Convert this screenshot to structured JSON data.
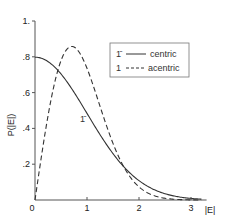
{
  "chart_data": {
    "type": "line",
    "title": "",
    "xlabel": "|E|",
    "ylabel": "P(|E|)",
    "xlim": [
      0,
      3.3
    ],
    "ylim": [
      0,
      1.0
    ],
    "x_ticks": [
      0,
      1,
      2,
      3
    ],
    "x_tick_labels": [
      "0",
      "1",
      "2",
      "3"
    ],
    "y_ticks": [
      0.2,
      0.4,
      0.6,
      0.8,
      1.0
    ],
    "y_tick_labels": [
      ".2",
      ".4",
      ".6",
      ".8",
      "1."
    ],
    "grid": false,
    "legend": {
      "placement": "top-right",
      "entries": [
        {
          "symbol": "1̄",
          "style": "solid",
          "label": "centric"
        },
        {
          "symbol": "1",
          "style": "dashed",
          "label": "acentric"
        }
      ]
    },
    "annotations": [
      {
        "text": "1̄",
        "series": "centric"
      },
      {
        "text": "1",
        "series": "acentric"
      }
    ],
    "series": [
      {
        "name": "centric",
        "style": "solid",
        "formula": "sqrt(2/pi)*exp(-E^2/2)",
        "x": [
          0,
          0.25,
          0.5,
          0.75,
          1.0,
          1.25,
          1.5,
          1.75,
          2.0,
          2.25,
          2.5,
          2.75,
          3.0,
          3.2
        ],
        "y": [
          0.798,
          0.773,
          0.704,
          0.601,
          0.484,
          0.366,
          0.26,
          0.173,
          0.108,
          0.064,
          0.035,
          0.018,
          0.009,
          0.005
        ]
      },
      {
        "name": "acentric",
        "style": "dashed",
        "formula": "2*E*exp(-E^2)",
        "x": [
          0,
          0.25,
          0.5,
          0.707,
          0.75,
          1.0,
          1.25,
          1.5,
          1.75,
          2.0,
          2.25,
          2.5,
          2.75,
          3.0,
          3.2
        ],
        "y": [
          0.0,
          0.47,
          0.779,
          0.858,
          0.855,
          0.736,
          0.524,
          0.316,
          0.163,
          0.073,
          0.028,
          0.01,
          0.003,
          0.001,
          0.0002
        ]
      }
    ]
  }
}
